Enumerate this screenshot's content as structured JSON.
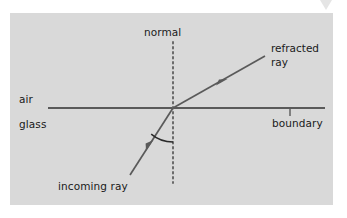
{
  "figure": {
    "kind": "ray-diagram",
    "panel": {
      "background_color": "#d9d9d9",
      "x": 10,
      "y": 13,
      "width": 323,
      "height": 192
    },
    "canvas": {
      "background_color": "#ffffff",
      "width": 347,
      "height": 218
    },
    "colors": {
      "line": "#5a5a5a",
      "boundary": "#5a5a5a",
      "normal": "#6a6a6a",
      "text": "#1a1a1a",
      "corner_mark": "#c8c8c8"
    },
    "geometry": {
      "incidence_point": {
        "x": 173,
        "y": 108
      },
      "boundary": {
        "x1": 48,
        "y1": 108,
        "x2": 325,
        "y2": 108
      },
      "normal": {
        "x": 173,
        "y1": 42,
        "y2": 183,
        "style": "dotted"
      },
      "incoming_ray": {
        "x1": 130,
        "y1": 175,
        "x2": 173,
        "y2": 108
      },
      "refracted_ray": {
        "x1": 173,
        "y1": 108,
        "x2": 265,
        "y2": 56
      },
      "incoming_arrow_marker": {
        "x": 150,
        "y": 145
      },
      "refracted_arrow_marker": {
        "x": 222,
        "y": 82
      },
      "angle_arc": {
        "center_x": 173,
        "center_y": 108,
        "radius": 34
      },
      "boundary_tick": {
        "x": 290,
        "y1": 108,
        "y2": 116
      }
    },
    "labels": {
      "normal": "normal",
      "refracted_ray_line1": "refracted",
      "refracted_ray_line2": "ray",
      "air": "air",
      "glass": "glass",
      "boundary": "boundary",
      "incoming_ray": "incoming ray"
    }
  }
}
